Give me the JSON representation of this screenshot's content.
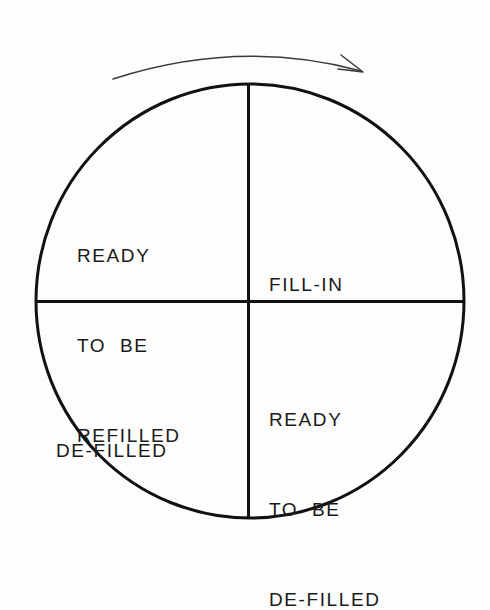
{
  "diagram": {
    "background_color": "#fdfdfd",
    "stroke_color": "#111111",
    "text_color": "#1a1a1a",
    "rotation": {
      "direction": "clockwise",
      "arrow_label": ""
    },
    "circle": {
      "center_x": 250,
      "center_y": 301,
      "radius_x": 214,
      "radius_y": 217,
      "stroke_width": 3
    },
    "quadrants": [
      {
        "id": "top-left",
        "name": "ready-to-be-refilled",
        "lines": [
          "READY",
          "TO  BE",
          "REFILLED"
        ]
      },
      {
        "id": "top-right",
        "name": "fill-in",
        "lines": [
          "FILL-IN"
        ]
      },
      {
        "id": "bottom-left",
        "name": "de-filled",
        "lines": [
          "DE-FILLED"
        ]
      },
      {
        "id": "bottom-right",
        "name": "ready-to-be-de-filled",
        "lines": [
          "READY",
          "TO  BE",
          "DE-FILLED"
        ]
      }
    ]
  }
}
